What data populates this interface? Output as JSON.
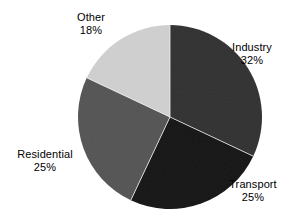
{
  "chart_data": {
    "type": "pie",
    "title": "",
    "subtitle": "",
    "xlabel": "",
    "ylabel": "",
    "grid": false,
    "legend_position": "none",
    "labels_position": "outside",
    "start_angle_deg": 0,
    "direction": "clockwise",
    "center": {
      "x": 170,
      "y": 117
    },
    "radius": 92,
    "categories": [
      "Industry",
      "Transport",
      "Residential",
      "Other"
    ],
    "values": [
      32,
      25,
      25,
      18
    ],
    "value_unit": "%",
    "colors": [
      "#333333",
      "#131313",
      "#555555",
      "#d0d0d0"
    ],
    "slices": [
      {
        "name": "Industry",
        "value": 32,
        "value_text": "32%",
        "color": "#333333",
        "start_deg": 0,
        "end_deg": 115.2
      },
      {
        "name": "Transport",
        "value": 25,
        "value_text": "25%",
        "color": "#131313",
        "start_deg": 115.2,
        "end_deg": 205.2
      },
      {
        "name": "Residential",
        "value": 25,
        "value_text": "25%",
        "color": "#555555",
        "start_deg": 205.2,
        "end_deg": 295.2
      },
      {
        "name": "Other",
        "value": 18,
        "value_text": "18%",
        "color": "#d0d0d0",
        "start_deg": 295.2,
        "end_deg": 360
      }
    ]
  },
  "labels": {
    "other": {
      "name": "Other",
      "value": "18%"
    },
    "industry": {
      "name": "Industry",
      "value": "32%"
    },
    "transport": {
      "name": "Transport",
      "value": "25%"
    },
    "residential": {
      "name": "Residential",
      "value": "25%"
    }
  },
  "style": {
    "background": "#ffffff",
    "text_color": "#000000",
    "slice_edge_color": "#ffffff"
  }
}
